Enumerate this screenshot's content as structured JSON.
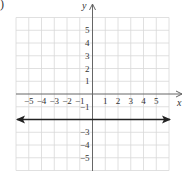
{
  "part_label": ")",
  "chart_data": {
    "type": "line",
    "title": "",
    "xlabel": "x",
    "ylabel": "y",
    "xlim": [
      -6,
      6
    ],
    "ylim": [
      -6,
      6
    ],
    "grid": true,
    "x_ticks": [
      -5,
      -4,
      -3,
      -2,
      -1,
      1,
      2,
      3,
      4,
      5
    ],
    "y_ticks": [
      5,
      4,
      3,
      2,
      1,
      -1,
      -3,
      -4,
      -5
    ],
    "x_tick_labels": [
      "−5",
      "−4",
      "−3",
      "−2",
      "−1",
      "1",
      "2",
      "3",
      "4",
      "5"
    ],
    "y_tick_labels": [
      "5",
      "4",
      "3",
      "2",
      "1",
      "−1",
      "−3",
      "−4",
      "−5"
    ],
    "series": [
      {
        "name": "y = -2",
        "equation": "y = -2",
        "x": [
          -6,
          6
        ],
        "y": [
          -2,
          -2
        ],
        "arrows": "both",
        "color": "#222222"
      }
    ]
  },
  "colors": {
    "grid": "#d8d8d8",
    "axis": "#666666",
    "line": "#222222",
    "text": "#333333"
  }
}
